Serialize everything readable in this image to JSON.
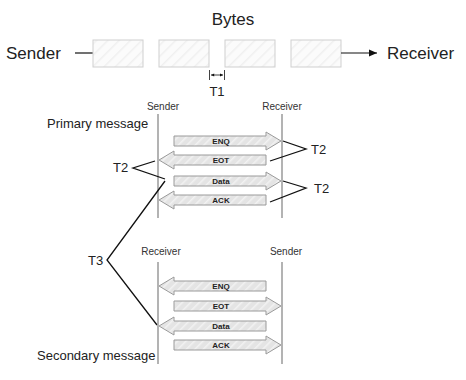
{
  "top": {
    "title": "Bytes",
    "sender_label": "Sender",
    "receiver_label": "Receiver",
    "byte_count": 4,
    "gap_label": "T1"
  },
  "primary": {
    "title": "Primary message",
    "left_label": "Sender",
    "right_label": "Receiver",
    "arrows": [
      {
        "label": "ENQ",
        "direction": "right"
      },
      {
        "label": "EOT",
        "direction": "left"
      },
      {
        "label": "Data",
        "direction": "right"
      },
      {
        "label": "ACK",
        "direction": "left"
      }
    ],
    "timing_labels": {
      "right_top": "T2",
      "left_mid": "T2",
      "right_bottom": "T2"
    }
  },
  "between": {
    "timing_label": "T3"
  },
  "secondary": {
    "title": "Secondary message",
    "left_label": "Receiver",
    "right_label": "Sender",
    "arrows": [
      {
        "label": "ENQ",
        "direction": "left"
      },
      {
        "label": "EOT",
        "direction": "right"
      },
      {
        "label": "Data",
        "direction": "left"
      },
      {
        "label": "ACK",
        "direction": "right"
      }
    ]
  },
  "colors": {
    "line": "#111111",
    "lifeline": "#8a8a8a",
    "arrow_fill": "#e2e2e2",
    "arrow_stroke": "#9a9a9a",
    "byte_box_stroke": "#cfcfcf"
  }
}
